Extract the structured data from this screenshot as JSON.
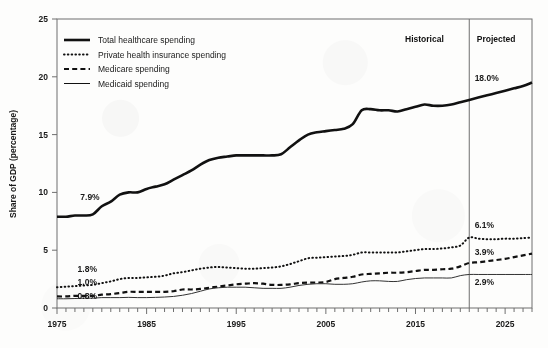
{
  "chart_data": {
    "type": "line",
    "title": "",
    "xlabel": "",
    "ylabel": "Share of GDP (percentage)",
    "xlim": [
      1975,
      2028
    ],
    "ylim": [
      0,
      25
    ],
    "yticks": [
      0,
      5,
      10,
      15,
      20,
      25
    ],
    "ytick_labels": [
      "0",
      "5",
      "10",
      "15",
      "20",
      "25"
    ],
    "xticks": [
      1975,
      1985,
      1995,
      2005,
      2015,
      2025
    ],
    "xtick_labels": [
      "1975",
      "1985",
      "1995",
      "2005",
      "2015",
      "2025"
    ],
    "minor_xtick_interval": 1,
    "grid": false,
    "legend_position": "upper-left-inside",
    "divider_year": 2021,
    "regions": [
      {
        "name": "historical-region",
        "label": "Historical",
        "label_x": 2016,
        "label_y": 23.0
      },
      {
        "name": "projected-region",
        "label": "Projected",
        "label_x": 2024,
        "label_y": 23.0
      }
    ],
    "annotations": [
      {
        "name": "total-start-annotation",
        "text": "7.9%",
        "x": 1977.6,
        "y": 9.3,
        "series": "Total healthcare spending"
      },
      {
        "name": "total-2021-annotation",
        "text": "18.0%",
        "x": 2021.6,
        "y": 19.6,
        "series": "Total healthcare spending"
      },
      {
        "name": "private-start-annotation",
        "text": "1.8%",
        "x": 1977.3,
        "y": 3.1,
        "series": "Private health insurance spending"
      },
      {
        "name": "medicare-start-annotation",
        "text": "1.0%",
        "x": 1977.3,
        "y": 1.95,
        "series": "Medicare spending"
      },
      {
        "name": "medicaid-start-annotation",
        "text": "0.8%",
        "x": 1977.3,
        "y": 0.75,
        "series": "Medicaid spending"
      },
      {
        "name": "private-2021-annotation",
        "text": "6.1%",
        "x": 2021.6,
        "y": 6.95,
        "series": "Private health insurance spending"
      },
      {
        "name": "medicare-2021-annotation",
        "text": "3.9%",
        "x": 2021.6,
        "y": 4.55,
        "series": "Medicare spending"
      },
      {
        "name": "medicaid-2021-annotation",
        "text": "2.9%",
        "x": 2021.6,
        "y": 1.95,
        "series": "Medicaid spending"
      }
    ],
    "series": [
      {
        "name": "Total healthcare spending",
        "style": "solid-thick",
        "color": "#111111",
        "x": [
          1975,
          1976,
          1977,
          1978,
          1979,
          1980,
          1981,
          1982,
          1983,
          1984,
          1985,
          1986,
          1987,
          1988,
          1989,
          1990,
          1991,
          1992,
          1993,
          1994,
          1995,
          1996,
          1997,
          1998,
          1999,
          2000,
          2001,
          2002,
          2003,
          2004,
          2005,
          2006,
          2007,
          2008,
          2009,
          2010,
          2011,
          2012,
          2013,
          2014,
          2015,
          2016,
          2017,
          2018,
          2019,
          2020,
          2021,
          2022,
          2023,
          2024,
          2025,
          2026,
          2027,
          2028
        ],
        "values": [
          7.9,
          7.9,
          8.0,
          8.0,
          8.1,
          8.8,
          9.2,
          9.8,
          10.0,
          10.0,
          10.3,
          10.5,
          10.7,
          11.1,
          11.5,
          11.9,
          12.4,
          12.8,
          13.0,
          13.1,
          13.2,
          13.2,
          13.2,
          13.2,
          13.2,
          13.3,
          13.9,
          14.5,
          15.0,
          15.2,
          15.3,
          15.4,
          15.5,
          15.9,
          17.1,
          17.2,
          17.1,
          17.1,
          17.0,
          17.2,
          17.4,
          17.6,
          17.5,
          17.5,
          17.6,
          17.8,
          18.0,
          18.2,
          18.4,
          18.6,
          18.8,
          19.0,
          19.2,
          19.5
        ]
      },
      {
        "name": "Private health insurance spending",
        "style": "dotted",
        "color": "#111111",
        "x": [
          1975,
          1976,
          1977,
          1978,
          1979,
          1980,
          1981,
          1982,
          1983,
          1984,
          1985,
          1986,
          1987,
          1988,
          1989,
          1990,
          1991,
          1992,
          1993,
          1994,
          1995,
          1996,
          1997,
          1998,
          1999,
          2000,
          2001,
          2002,
          2003,
          2004,
          2005,
          2006,
          2007,
          2008,
          2009,
          2010,
          2011,
          2012,
          2013,
          2014,
          2015,
          2016,
          2017,
          2018,
          2019,
          2020,
          2021,
          2022,
          2023,
          2024,
          2025,
          2026,
          2027,
          2028
        ],
        "values": [
          1.8,
          1.85,
          1.9,
          1.95,
          2.0,
          2.15,
          2.3,
          2.5,
          2.6,
          2.6,
          2.65,
          2.7,
          2.8,
          3.0,
          3.1,
          3.25,
          3.4,
          3.5,
          3.55,
          3.5,
          3.45,
          3.4,
          3.4,
          3.45,
          3.5,
          3.6,
          3.8,
          4.05,
          4.3,
          4.35,
          4.4,
          4.45,
          4.5,
          4.6,
          4.8,
          4.8,
          4.8,
          4.8,
          4.8,
          4.9,
          5.0,
          5.1,
          5.1,
          5.15,
          5.25,
          5.4,
          6.1,
          6.0,
          5.95,
          5.95,
          6.0,
          6.0,
          6.05,
          6.1
        ]
      },
      {
        "name": "Medicare spending",
        "style": "dashed",
        "color": "#111111",
        "x": [
          1975,
          1976,
          1977,
          1978,
          1979,
          1980,
          1981,
          1982,
          1983,
          1984,
          1985,
          1986,
          1987,
          1988,
          1989,
          1990,
          1991,
          1992,
          1993,
          1994,
          1995,
          1996,
          1997,
          1998,
          1999,
          2000,
          2001,
          2002,
          2003,
          2004,
          2005,
          2006,
          2007,
          2008,
          2009,
          2010,
          2011,
          2012,
          2013,
          2014,
          2015,
          2016,
          2017,
          2018,
          2019,
          2020,
          2021,
          2022,
          2023,
          2024,
          2025,
          2026,
          2027,
          2028
        ],
        "values": [
          1.0,
          1.0,
          1.05,
          1.05,
          1.05,
          1.15,
          1.2,
          1.3,
          1.4,
          1.4,
          1.4,
          1.4,
          1.4,
          1.45,
          1.6,
          1.6,
          1.65,
          1.75,
          1.85,
          1.95,
          2.05,
          2.1,
          2.15,
          2.1,
          2.0,
          2.0,
          2.05,
          2.15,
          2.2,
          2.2,
          2.25,
          2.5,
          2.6,
          2.7,
          2.9,
          2.95,
          3.0,
          3.05,
          3.05,
          3.1,
          3.2,
          3.3,
          3.3,
          3.35,
          3.4,
          3.6,
          3.9,
          3.95,
          4.05,
          4.15,
          4.25,
          4.4,
          4.55,
          4.7
        ]
      },
      {
        "name": "Medicaid spending",
        "style": "solid-thin",
        "color": "#333333",
        "x": [
          1975,
          1976,
          1977,
          1978,
          1979,
          1980,
          1981,
          1982,
          1983,
          1984,
          1985,
          1986,
          1987,
          1988,
          1989,
          1990,
          1991,
          1992,
          1993,
          1994,
          1995,
          1996,
          1997,
          1998,
          1999,
          2000,
          2001,
          2002,
          2003,
          2004,
          2005,
          2006,
          2007,
          2008,
          2009,
          2010,
          2011,
          2012,
          2013,
          2014,
          2015,
          2016,
          2017,
          2018,
          2019,
          2020,
          2021,
          2022,
          2023,
          2024,
          2025,
          2026,
          2027,
          2028
        ],
        "values": [
          0.8,
          0.8,
          0.82,
          0.85,
          0.85,
          0.9,
          0.9,
          0.9,
          0.92,
          0.9,
          0.9,
          0.92,
          0.95,
          1.0,
          1.1,
          1.25,
          1.45,
          1.65,
          1.75,
          1.8,
          1.8,
          1.8,
          1.75,
          1.7,
          1.7,
          1.7,
          1.8,
          1.95,
          2.05,
          2.1,
          2.1,
          2.05,
          2.05,
          2.1,
          2.25,
          2.35,
          2.35,
          2.3,
          2.3,
          2.45,
          2.55,
          2.6,
          2.6,
          2.6,
          2.6,
          2.8,
          2.9,
          2.9,
          2.9,
          2.9,
          2.9,
          2.9,
          2.9,
          2.9
        ]
      }
    ]
  },
  "legend": {
    "items": [
      {
        "label": "Total healthcare spending",
        "style": "solid-thick"
      },
      {
        "label": "Private health insurance spending",
        "style": "dotted"
      },
      {
        "label": "Medicare spending",
        "style": "dashed"
      },
      {
        "label": "Medicaid spending",
        "style": "solid-thin"
      }
    ]
  }
}
